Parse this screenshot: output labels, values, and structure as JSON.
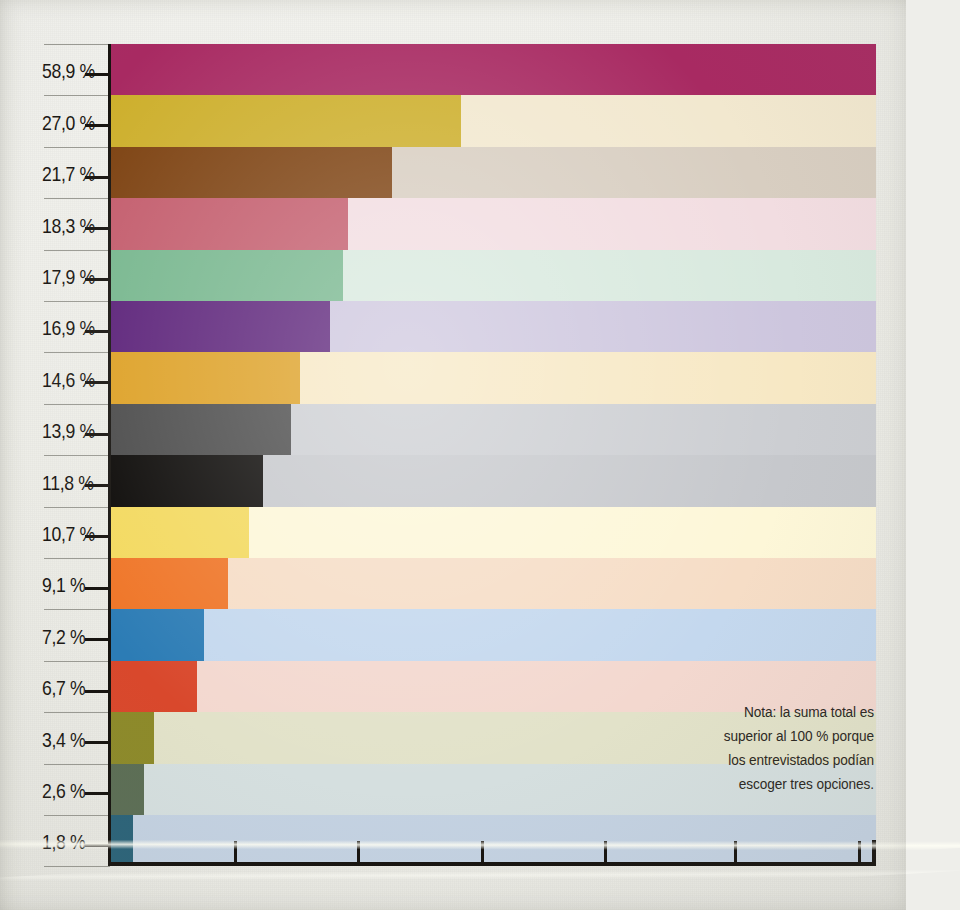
{
  "chart_data": {
    "type": "bar",
    "orientation": "horizontal",
    "title": "",
    "subtitle": "",
    "xlabel": "",
    "ylabel": "",
    "grid": false,
    "legend": null,
    "xlim": [
      0,
      58.9
    ],
    "x_tick_values": [
      9.5,
      19.0,
      28.5,
      38.0,
      48.0,
      57.5
    ],
    "value_suffix": " %",
    "decimal_separator": ",",
    "categories": [
      "58,9 %",
      "27,0 %",
      "21,7 %",
      "18,3 %",
      "17,9 %",
      "16,9 %",
      "14,6 %",
      "13,9 %",
      "11,8 %",
      "10,7 %",
      "9,1 %",
      "7,2 %",
      "6,7 %",
      "3,4 %",
      "2,6 %",
      "1,8 %"
    ],
    "values": [
      58.9,
      27.0,
      21.7,
      18.3,
      17.9,
      16.9,
      14.6,
      13.9,
      11.8,
      10.7,
      9.1,
      7.2,
      6.7,
      3.4,
      2.6,
      1.8
    ],
    "labels": [
      "58,9 %",
      "27,0 %",
      "21,7 %",
      "18,3 %",
      "17,9 %",
      "16,9 %",
      "14,6 %",
      "13,9 %",
      "11,8 %",
      "10,7 %",
      "9,1 %",
      "7,2 %",
      "6,7 %",
      "3,4 %",
      "2,6 %",
      "1,8 %"
    ],
    "bar_colors": [
      "#a82a62",
      "#cdaf2c",
      "#7d4211",
      "#c35c6c",
      "#76b68d",
      "#5a2078",
      "#dda024",
      "#4a4a4a",
      "#0a0806",
      "#f3d95e",
      "#ef7527",
      "#2c7cb5",
      "#d9482c",
      "#8d8a2a",
      "#5c6e55",
      "#2b6379"
    ],
    "tint_colors": [
      "#e9d9e0",
      "#f2e8cf",
      "#d8cec1",
      "#f2dde1",
      "#d8e9de",
      "#cdc6de",
      "#f7e8c4",
      "#ccced2",
      "#c6c8cc",
      "#fdf7d8",
      "#f6ddc6",
      "#c4d8ee",
      "#f3d8cf",
      "#e2e2c9",
      "#d5dfdf",
      "#c4d2e2"
    ],
    "annotations": {
      "note_lines": [
        "Nota: la suma total es",
        "superior al 100 % porque",
        "los entrevistados podían",
        "escoger tres opciones."
      ]
    }
  },
  "page": {
    "background_color": "#eeeeea",
    "axis_color": "#16130f",
    "label_color": "#1b1814",
    "separator_color": "#9a9a93"
  }
}
